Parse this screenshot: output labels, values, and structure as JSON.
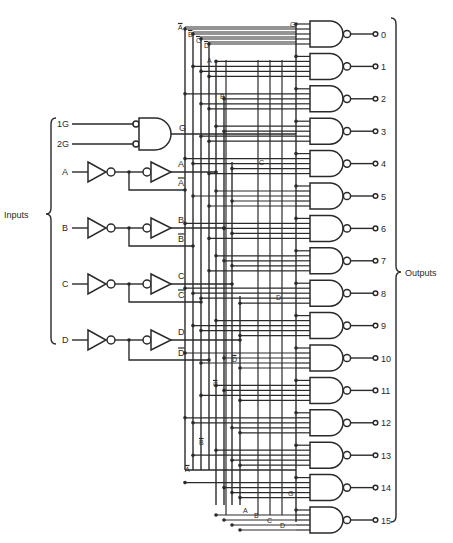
{
  "title": {
    "line1": "74154",
    "line2": "Decoder /",
    "line3": "demultiplexer"
  },
  "labels": {
    "inputs": "Inputs",
    "outputs": "Outputs",
    "enable1": "1G",
    "enable2": "2G",
    "enable_out": "G"
  },
  "inputs": [
    {
      "name": "A",
      "true": "A",
      "comp": "A"
    },
    {
      "name": "B",
      "true": "B",
      "comp": "B"
    },
    {
      "name": "C",
      "true": "C",
      "comp": "C"
    },
    {
      "name": "D",
      "true": "D",
      "comp": "D"
    }
  ],
  "bus_labels": {
    "top": [
      "A",
      "B",
      "C",
      "D"
    ],
    "top_true_a": "A",
    "top_true_b": "B",
    "top_true_c": "C",
    "mid_true_d": "D",
    "mid_comp_d": "D",
    "mid_comp_c": "C",
    "mid_comp_b": "B",
    "mid_comp_a": "A",
    "bottom": [
      "A",
      "B",
      "C",
      "D"
    ],
    "g_top": "G",
    "g_bottom": "G"
  },
  "outputs": [
    "0",
    "1",
    "2",
    "3",
    "4",
    "5",
    "6",
    "7",
    "8",
    "9",
    "10",
    "11",
    "12",
    "13",
    "14",
    "15"
  ],
  "colors": {
    "ink": "#2a2a2a",
    "background": "#ffffff"
  }
}
